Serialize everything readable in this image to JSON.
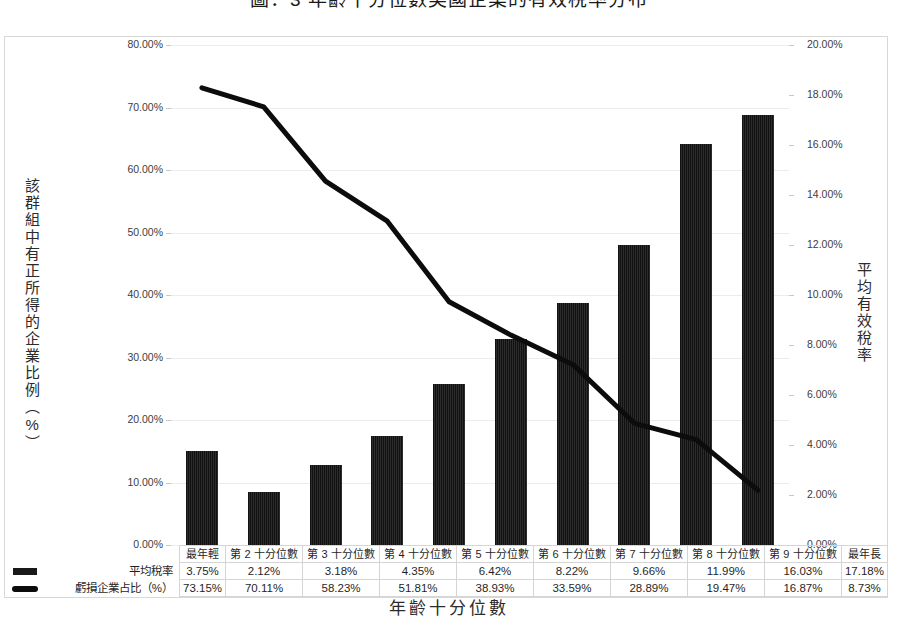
{
  "title": "圖：3 年齡十分位數美國企業的有效稅率分布",
  "axes": {
    "x_title": "年齡十分位數",
    "y_left_title": "該群組中有正所得的企業比例（%）",
    "y_right_title": "平均有效稅率",
    "y_left_ticks": [
      "0.00%",
      "10.00%",
      "20.00%",
      "30.00%",
      "40.00%",
      "50.00%",
      "60.00%",
      "70.00%",
      "80.00%"
    ],
    "y_right_ticks": [
      "0.00%",
      "2.00%",
      "4.00%",
      "6.00%",
      "8.00%",
      "10.00%",
      "12.00%",
      "14.00%",
      "16.00%",
      "18.00%",
      "20.00%"
    ]
  },
  "legend": {
    "bar_label": "平均稅率",
    "line_label": "虧損企業占比（%）",
    "bar_marker": "bar-marker-icon",
    "line_marker": "line-marker-icon"
  },
  "table": {
    "headers": [
      "最年輕",
      "第 2 十分位數",
      "第 3 十分位數",
      "第 4 十分位數",
      "第 5 十分位數",
      "第 6 十分位數",
      "第 7 十分位數",
      "第 8 十分位數",
      "第 9 十分位數",
      "最年長"
    ],
    "row_bar": [
      "3.75%",
      "2.12%",
      "3.18%",
      "4.35%",
      "6.42%",
      "8.22%",
      "9.66%",
      "11.99%",
      "16.03%",
      "17.18%"
    ],
    "row_line": [
      "73.15%",
      "70.11%",
      "58.23%",
      "51.81%",
      "38.93%",
      "33.59%",
      "28.89%",
      "19.47%",
      "16.87%",
      "8.73%"
    ]
  },
  "chart_data": {
    "type": "bar",
    "title": "圖：3 年齡十分位數美國企業的有效稅率分布",
    "xlabel": "年齡十分位數",
    "ylabel": "該群組中有正所得的企業比例（%）",
    "y2label": "平均有效稅率",
    "categories": [
      "最年輕",
      "第 2 十分位數",
      "第 3 十分位數",
      "第 4 十分位數",
      "第 5 十分位數",
      "第 6 十分位數",
      "第 7 十分位數",
      "第 8 十分位數",
      "第 9 十分位數",
      "最年長"
    ],
    "series": [
      {
        "name": "平均稅率",
        "type": "bar",
        "axis": "right",
        "color": "#191919",
        "values": [
          3.75,
          2.12,
          3.18,
          4.35,
          6.42,
          8.22,
          9.66,
          11.99,
          16.03,
          17.18
        ],
        "labels": [
          "3.75%",
          "2.12%",
          "3.18%",
          "4.35%",
          "6.42%",
          "8.22%",
          "9.66%",
          "11.99%",
          "16.03%",
          "17.18%"
        ]
      },
      {
        "name": "虧損企業占比（%）",
        "type": "line",
        "axis": "left",
        "color": "#0c0c0c",
        "values": [
          73.15,
          70.11,
          58.23,
          51.81,
          38.93,
          33.59,
          28.89,
          19.47,
          16.87,
          8.73
        ],
        "labels": [
          "73.15%",
          "70.11%",
          "58.23%",
          "51.81%",
          "38.93%",
          "33.59%",
          "28.89%",
          "19.47%",
          "16.87%",
          "8.73%"
        ]
      }
    ],
    "ylim": [
      0,
      80
    ],
    "y2lim": [
      0,
      20
    ],
    "ytick_step": 10,
    "y2tick_step": 2,
    "grid": true,
    "legend_position": "bottom-table"
  }
}
